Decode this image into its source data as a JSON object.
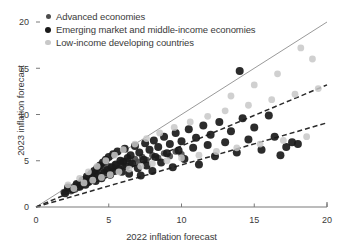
{
  "chart_data": {
    "type": "scatter",
    "title": "",
    "xlabel": "2022 inflation forecast",
    "ylabel": "2023 inflation forecast",
    "xlim": [
      0,
      20
    ],
    "ylim": [
      0,
      20
    ],
    "xticks": [
      0,
      5,
      10,
      15,
      20
    ],
    "yticks": [
      0,
      5,
      10,
      15,
      20
    ],
    "xtick_labels": [
      "0",
      "5",
      "10",
      "15",
      "20"
    ],
    "ytick_labels": [
      "0",
      "5",
      "10",
      "15",
      "20"
    ],
    "grid": false,
    "legend_position": "top-left",
    "series": [
      {
        "name": "Advanced economies",
        "color": "#4d4d4d",
        "marker": "circle",
        "marker_size": 3.2,
        "points": [
          [
            1.9,
            1.6
          ],
          [
            2.1,
            1.8
          ],
          [
            2.3,
            2.0
          ],
          [
            2.4,
            1.7
          ],
          [
            2.6,
            2.2
          ],
          [
            2.7,
            1.9
          ],
          [
            2.8,
            2.4
          ],
          [
            2.9,
            2.1
          ],
          [
            3.0,
            2.6
          ],
          [
            3.1,
            2.3
          ],
          [
            3.2,
            2.8
          ],
          [
            3.3,
            2.5
          ],
          [
            3.4,
            3.0
          ],
          [
            3.5,
            2.7
          ],
          [
            3.6,
            3.2
          ],
          [
            3.7,
            2.9
          ],
          [
            3.8,
            3.4
          ],
          [
            3.9,
            3.1
          ],
          [
            4.0,
            3.6
          ],
          [
            4.1,
            3.3
          ],
          [
            4.2,
            3.8
          ],
          [
            4.3,
            3.5
          ],
          [
            4.4,
            4.0
          ],
          [
            4.5,
            3.7
          ],
          [
            4.6,
            4.2
          ],
          [
            4.8,
            3.9
          ],
          [
            5.0,
            4.4
          ],
          [
            5.2,
            4.1
          ],
          [
            5.4,
            4.6
          ],
          [
            5.6,
            4.3
          ],
          [
            5.8,
            4.8
          ],
          [
            6.0,
            4.5
          ],
          [
            6.2,
            5.0
          ],
          [
            6.5,
            4.7
          ],
          [
            6.8,
            5.2
          ],
          [
            7.0,
            4.9
          ],
          [
            7.3,
            5.4
          ],
          [
            7.6,
            5.1
          ],
          [
            8.0,
            5.6
          ],
          [
            8.4,
            5.3
          ],
          [
            8.8,
            5.8
          ],
          [
            9.2,
            5.5
          ],
          [
            9.6,
            6.0
          ],
          [
            10.0,
            5.7
          ]
        ]
      },
      {
        "name": "Emerging market and middle-income economies",
        "color": "#1a1a1a",
        "marker": "circle",
        "marker_size": 4.0,
        "points": [
          [
            2.0,
            1.5
          ],
          [
            2.2,
            2.1
          ],
          [
            2.5,
            1.9
          ],
          [
            2.8,
            2.5
          ],
          [
            3.0,
            2.2
          ],
          [
            3.2,
            2.9
          ],
          [
            3.4,
            2.4
          ],
          [
            3.5,
            3.3
          ],
          [
            3.6,
            2.7
          ],
          [
            3.8,
            3.6
          ],
          [
            3.9,
            3.0
          ],
          [
            4.0,
            3.9
          ],
          [
            4.1,
            2.8
          ],
          [
            4.2,
            4.2
          ],
          [
            4.3,
            3.4
          ],
          [
            4.4,
            4.5
          ],
          [
            4.5,
            3.1
          ],
          [
            4.6,
            4.8
          ],
          [
            4.7,
            3.7
          ],
          [
            4.8,
            5.1
          ],
          [
            4.9,
            4.0
          ],
          [
            5.0,
            5.4
          ],
          [
            5.1,
            3.5
          ],
          [
            5.2,
            4.3
          ],
          [
            5.3,
            5.7
          ],
          [
            5.4,
            3.9
          ],
          [
            5.5,
            4.6
          ],
          [
            5.6,
            6.0
          ],
          [
            5.7,
            4.1
          ],
          [
            5.8,
            5.0
          ],
          [
            5.9,
            3.8
          ],
          [
            6.0,
            4.9
          ],
          [
            6.1,
            6.3
          ],
          [
            6.2,
            4.4
          ],
          [
            6.3,
            5.3
          ],
          [
            6.4,
            3.6
          ],
          [
            6.5,
            5.6
          ],
          [
            6.6,
            4.7
          ],
          [
            6.8,
            6.6
          ],
          [
            7.0,
            4.2
          ],
          [
            7.1,
            5.9
          ],
          [
            7.2,
            3.4
          ],
          [
            7.4,
            5.1
          ],
          [
            7.5,
            6.9
          ],
          [
            7.6,
            4.5
          ],
          [
            7.8,
            6.2
          ],
          [
            8.0,
            3.9
          ],
          [
            8.1,
            7.2
          ],
          [
            8.2,
            5.4
          ],
          [
            8.4,
            6.5
          ],
          [
            8.6,
            4.8
          ],
          [
            8.8,
            7.6
          ],
          [
            9.0,
            5.8
          ],
          [
            9.2,
            6.8
          ],
          [
            9.4,
            4.3
          ],
          [
            9.6,
            8.0
          ],
          [
            9.8,
            6.1
          ],
          [
            10.0,
            7.1
          ],
          [
            10.2,
            5.2
          ],
          [
            10.5,
            8.4
          ],
          [
            10.8,
            6.4
          ],
          [
            11.0,
            7.5
          ],
          [
            11.2,
            4.6
          ],
          [
            11.5,
            8.8
          ],
          [
            11.8,
            6.7
          ],
          [
            12.0,
            7.8
          ],
          [
            12.3,
            5.5
          ],
          [
            12.6,
            9.2
          ],
          [
            13.0,
            7.0
          ],
          [
            13.4,
            8.2
          ],
          [
            13.8,
            5.9
          ],
          [
            14.0,
            14.7
          ],
          [
            14.2,
            9.6
          ],
          [
            14.6,
            7.3
          ],
          [
            15.0,
            8.6
          ],
          [
            15.5,
            6.2
          ],
          [
            16.0,
            9.9
          ],
          [
            16.4,
            7.6
          ],
          [
            16.8,
            5.6
          ],
          [
            17.2,
            6.5
          ],
          [
            17.6,
            7.0
          ],
          [
            18.0,
            6.8
          ]
        ]
      },
      {
        "name": "Low-income developing countries",
        "color": "#c8c8c8",
        "marker": "circle",
        "marker_size": 3.4,
        "points": [
          [
            2.2,
            2.4
          ],
          [
            2.6,
            2.0
          ],
          [
            3.0,
            3.1
          ],
          [
            3.3,
            2.6
          ],
          [
            3.6,
            3.8
          ],
          [
            3.9,
            2.9
          ],
          [
            4.2,
            4.4
          ],
          [
            4.5,
            3.2
          ],
          [
            4.8,
            5.0
          ],
          [
            5.1,
            3.5
          ],
          [
            5.4,
            5.6
          ],
          [
            5.7,
            3.8
          ],
          [
            6.0,
            6.2
          ],
          [
            6.4,
            4.1
          ],
          [
            6.8,
            6.8
          ],
          [
            7.2,
            4.4
          ],
          [
            7.6,
            7.4
          ],
          [
            8.0,
            4.7
          ],
          [
            8.5,
            8.0
          ],
          [
            9.0,
            5.0
          ],
          [
            9.5,
            8.6
          ],
          [
            10.0,
            5.3
          ],
          [
            10.6,
            9.2
          ],
          [
            11.2,
            5.6
          ],
          [
            11.8,
            9.8
          ],
          [
            12.4,
            6.0
          ],
          [
            13.0,
            10.4
          ],
          [
            13.8,
            6.4
          ],
          [
            14.6,
            11.0
          ],
          [
            15.4,
            6.8
          ],
          [
            16.2,
            11.6
          ],
          [
            17.0,
            7.2
          ],
          [
            17.8,
            12.2
          ],
          [
            18.6,
            7.6
          ],
          [
            19.4,
            12.8
          ],
          [
            19.0,
            16.0
          ],
          [
            18.2,
            17.2
          ],
          [
            16.6,
            14.4
          ],
          [
            15.0,
            13.2
          ],
          [
            13.4,
            12.0
          ]
        ]
      }
    ],
    "reference_lines": [
      {
        "name": "45-degree-line",
        "style": "solid",
        "color": "#9a9a9a",
        "from": [
          0,
          0
        ],
        "to": [
          20,
          20
        ]
      },
      {
        "name": "fit-line-upper",
        "style": "dashed",
        "color": "#2a2a2a",
        "from": [
          0,
          0
        ],
        "to": [
          20,
          13.2
        ]
      },
      {
        "name": "fit-line-lower",
        "style": "dashed",
        "color": "#2a2a2a",
        "from": [
          0,
          0
        ],
        "to": [
          20,
          9.1
        ]
      }
    ]
  },
  "legend": {
    "items": [
      {
        "label": "Advanced economies",
        "color": "#4d4d4d",
        "size": 3.2
      },
      {
        "label": "Emerging market and middle-income economies",
        "color": "#1a1a1a",
        "size": 4.0
      },
      {
        "label": "Low-income developing countries",
        "color": "#c8c8c8",
        "size": 3.4
      }
    ]
  },
  "axes": {
    "x_title": "2022 inflation forecast",
    "y_title": "2023 inflation forecast",
    "axis_color": "#7a7a7a"
  }
}
